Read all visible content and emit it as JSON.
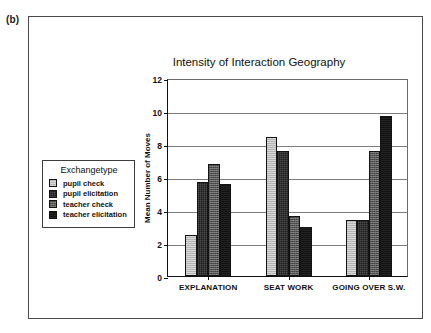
{
  "figure": {
    "panel_label": "(b)"
  },
  "legend": {
    "title": "Exchangetype",
    "position": "left-middle",
    "items": [
      {
        "label": "pupil check",
        "color": "#b6b6b6"
      },
      {
        "label": "pupil elicitation",
        "color": "#1d1d1d"
      },
      {
        "label": "teacher check",
        "color": "#565656"
      },
      {
        "label": "teacher elicitation",
        "color": "#121212"
      }
    ]
  },
  "chart_data": {
    "type": "bar",
    "title": "Intensity of Interaction Geography",
    "xlabel": "",
    "ylabel": "Mean Number of Moves",
    "categories": [
      "EXPLANATION",
      "SEAT WORK",
      "GOING OVER S.W."
    ],
    "series": [
      {
        "name": "pupil check",
        "color": "#b6b6b6",
        "values": [
          2.5,
          8.4,
          3.4
        ]
      },
      {
        "name": "pupil elicitation",
        "color": "#1d1d1d",
        "values": [
          5.7,
          7.6,
          3.4
        ]
      },
      {
        "name": "teacher check",
        "color": "#565656",
        "values": [
          6.8,
          3.65,
          7.6
        ]
      },
      {
        "name": "teacher elicitation",
        "color": "#121212",
        "values": [
          5.55,
          2.95,
          9.7
        ]
      }
    ],
    "ylim": [
      0,
      12
    ],
    "yticks": [
      0,
      2,
      4,
      6,
      8,
      10,
      12
    ],
    "grid": "horizontal",
    "legend_position": "left-middle"
  }
}
